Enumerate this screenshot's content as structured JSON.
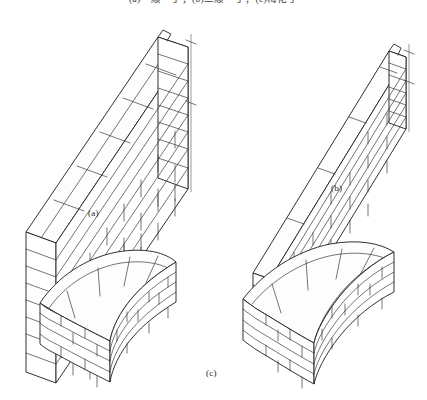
{
  "figure": {
    "top_caption": "(a)一顺一丁；(b)三顺一丁；(c)梅花丁",
    "sub_labels": {
      "a": "(a)",
      "b": "(b)",
      "c": "(c)"
    },
    "colors": {
      "background": "#ffffff",
      "ink": "#262626",
      "ink_light": "#3a3a3a",
      "guide_line": "#555555"
    },
    "panels": [
      {
        "id": "a",
        "label": "(a)",
        "bond": "一顺一丁",
        "description": "isometric thick brick wall, alternating stretcher and header courses, with vertical plumb guide line at right end",
        "courses": 8,
        "has_plumb_line": true
      },
      {
        "id": "b",
        "label": "(b)",
        "bond": "三顺一丁",
        "description": "isometric thin brick wall, running bond, six visible courses on end face, with plumb guide line at right end",
        "courses": 6,
        "has_plumb_line": true
      },
      {
        "id": "c",
        "label": "(c)",
        "bond": "梅花丁",
        "description": "two isometric curved brick wall segments, shallow curve at left and deeper curve at right",
        "segments": 2,
        "courses": 5,
        "has_plumb_line": false
      }
    ]
  }
}
